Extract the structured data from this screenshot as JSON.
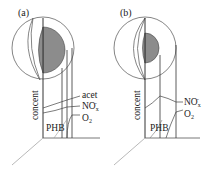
{
  "panels": [
    {
      "id": "a",
      "label": "(a)",
      "y_axis_label": "concent",
      "region_label": "PHB",
      "curves": [
        {
          "name": "acet",
          "label": "acet"
        },
        {
          "name": "NOx",
          "label": "NO",
          "sub": "x",
          "sup": "-"
        },
        {
          "name": "O2",
          "label": "O",
          "sub": "2"
        }
      ]
    },
    {
      "id": "b",
      "label": "(b)",
      "y_axis_label": "concent",
      "region_label": "PHB",
      "curves": [
        {
          "name": "NOx",
          "label": "NO",
          "sub": "x",
          "sup": "-"
        },
        {
          "name": "O2",
          "label": "O",
          "sub": "2"
        }
      ]
    }
  ],
  "colors": {
    "line": "#333333",
    "circle": "#555555",
    "shaded": "#8a8a8a",
    "light_line": "#999999"
  }
}
